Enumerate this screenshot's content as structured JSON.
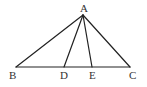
{
  "diagram": {
    "type": "triangle-with-cevians",
    "points": {
      "A": {
        "label": "A",
        "x": 83,
        "y": 15
      },
      "B": {
        "label": "B",
        "x": 16,
        "y": 67
      },
      "C": {
        "label": "C",
        "x": 130,
        "y": 67
      },
      "D": {
        "label": "D",
        "x": 64,
        "y": 67
      },
      "E": {
        "label": "E",
        "x": 92,
        "y": 67
      }
    },
    "segments": [
      [
        "A",
        "B"
      ],
      [
        "A",
        "C"
      ],
      [
        "B",
        "C"
      ],
      [
        "A",
        "D"
      ],
      [
        "A",
        "E"
      ]
    ],
    "labels": {
      "A": "A",
      "B": "B",
      "C": "C",
      "D": "D",
      "E": "E"
    },
    "stroke_color": "#222222",
    "label_color": "#333333"
  }
}
